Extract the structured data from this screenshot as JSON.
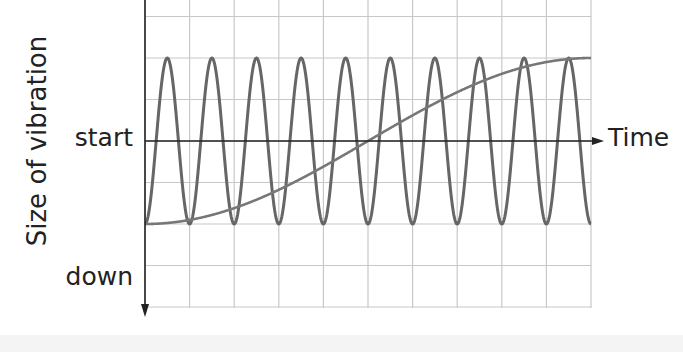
{
  "chart_data": {
    "type": "line",
    "title": "",
    "xlabel": "Time",
    "ylabel": "Size of vibration",
    "y_tick_labels": [
      "start",
      "down"
    ],
    "grid": true,
    "xlim": [
      0,
      10
    ],
    "ylim": [
      -2,
      2
    ],
    "x_gridlines": [
      0,
      1,
      2,
      3,
      4,
      5,
      6,
      7,
      8,
      9,
      10
    ],
    "y_gridlines": [
      3,
      2,
      1,
      0,
      -1,
      -2,
      -3,
      -4
    ],
    "series": [
      {
        "name": "high-frequency vibration",
        "description": "10 complete cycles over the time span, oscillating between -2 and +2 units (min at every grid line)",
        "cycles": 10,
        "min": -2,
        "max": 2,
        "peaks_x": [
          0.5,
          1.5,
          2.5,
          3.5,
          4.5,
          5.5,
          6.5,
          7.5,
          8.5,
          9.5
        ],
        "color": "#666666"
      },
      {
        "name": "low-frequency vibration",
        "description": "Half a cycle over the time span, rising from -2 at start to +2 at midpoint and back to -2",
        "cycles": 0.5,
        "min": -2,
        "max": 2,
        "peaks_x": [
          5
        ],
        "color": "#777777"
      }
    ]
  },
  "labels": {
    "ylabel": "Size of vibration",
    "start": "start",
    "down": "down",
    "time": "Time"
  },
  "colors": {
    "grid": "#c8c8c8",
    "axis": "#222222",
    "curve": "#666666"
  }
}
